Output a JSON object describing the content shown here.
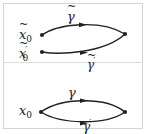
{
  "diagram": {
    "type": "path-homotopy-illustration",
    "colors": {
      "stroke": "#222222",
      "frame": "#d4d4d4",
      "background": "#ffffff"
    },
    "top_panel": {
      "start_points": [
        {
          "id": "x0_tilde",
          "base": "x",
          "subscript": "0",
          "prime": "",
          "tilde": true
        },
        {
          "id": "x0_tilde_prime",
          "base": "x",
          "subscript": "0",
          "prime": "′",
          "tilde": true
        }
      ],
      "paths": [
        {
          "id": "gamma_tilde",
          "base": "γ",
          "prime": "",
          "tilde": true,
          "from": "x0_tilde",
          "direction": "up-arc"
        },
        {
          "id": "gamma_tilde_prime",
          "base": "γ",
          "prime": "′",
          "tilde": true,
          "from": "x0_tilde_prime",
          "direction": "down-arc"
        }
      ],
      "end_point": "common endpoint"
    },
    "bottom_panel": {
      "start_points": [
        {
          "id": "x0",
          "base": "x",
          "subscript": "0",
          "prime": "",
          "tilde": false
        }
      ],
      "paths": [
        {
          "id": "gamma",
          "base": "γ",
          "prime": "",
          "tilde": false,
          "from": "x0",
          "direction": "up-arc"
        },
        {
          "id": "gamma_prime",
          "base": "γ",
          "prime": "′",
          "tilde": false,
          "from": "x0",
          "direction": "down-arc"
        }
      ],
      "end_point": "common endpoint"
    }
  },
  "labels": {
    "x": "x",
    "sub0": "0",
    "gamma": "γ",
    "prime": "′"
  }
}
